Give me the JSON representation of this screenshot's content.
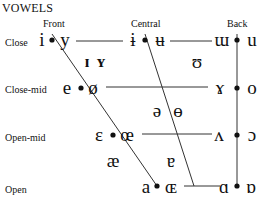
{
  "title": "VOWELS",
  "columns": {
    "front": "Front",
    "central": "Central",
    "back": "Back"
  },
  "rows": {
    "close": "Close",
    "close_mid": "Close-mid",
    "open_mid": "Open-mid",
    "open": "Open"
  },
  "vowels": {
    "close": {
      "front_unrounded": "i",
      "front_rounded": "y",
      "central_unrounded": "ɨ",
      "central_rounded": "ʉ",
      "back_unrounded": "ɯ",
      "back_rounded": "u"
    },
    "near_close": {
      "front_unrounded": "ɪ",
      "front_rounded": "ʏ",
      "back_rounded": "ʊ"
    },
    "close_mid": {
      "front_unrounded": "e",
      "front_rounded": "ø",
      "back_unrounded": "ɤ",
      "back_rounded": "o"
    },
    "mid": {
      "central_unrounded": "ə",
      "central_rounded": "ɵ"
    },
    "open_mid": {
      "front_unrounded": "ɛ",
      "front_rounded": "œ",
      "back_unrounded": "ʌ",
      "back_rounded": "ɔ"
    },
    "near_open": {
      "front_unrounded": "æ",
      "central": "ɐ"
    },
    "open": {
      "front_unrounded": "a",
      "front_rounded": "ɶ",
      "back_unrounded": "ɑ",
      "back_rounded": "ɒ"
    }
  },
  "colors": {
    "ink": "#111111",
    "line": "#333333"
  }
}
